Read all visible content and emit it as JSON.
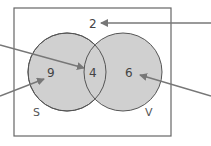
{
  "diagram": {
    "type": "venn",
    "universe_count": "2",
    "sets": [
      {
        "name": "S",
        "only_count": "9"
      },
      {
        "name": "V",
        "only_count": "6"
      }
    ],
    "intersection_count": "4",
    "colors": {
      "circle_fill": "#cfcfcf",
      "stroke": "#555555",
      "arrow": "#777777",
      "frame": "#666666"
    }
  }
}
